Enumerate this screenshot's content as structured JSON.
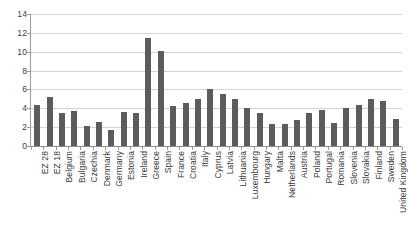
{
  "chart_data": {
    "type": "bar",
    "title": "",
    "subtitle": "",
    "xlabel": "",
    "ylabel": "",
    "ylim": [
      0,
      14
    ],
    "ytick_step": 2,
    "yticks": [
      "0",
      "2",
      "4",
      "6",
      "8",
      "10",
      "12",
      "14"
    ],
    "grid": true,
    "legend": false,
    "bar_color": "#5c5c5c",
    "gridline_color": "#d4d4d4",
    "axis_color": "#9a9a9a",
    "categories": [
      "EZ 28",
      "EZ 18",
      "Belgium",
      "Bulgaria",
      "Czechia",
      "Denmark",
      "Germany",
      "Estonia",
      "Ireland",
      "Greece",
      "Spain",
      "France",
      "Croatia",
      "Italy",
      "Cyprus",
      "Latvia",
      "Lithuania",
      "Luxembourg",
      "Hungary",
      "Malta",
      "Netherlands",
      "Austria",
      "Poland",
      "Portugal",
      "Romania",
      "Slovenia",
      "Slovakia",
      "Finland",
      "Sweden",
      "United Kingdom"
    ],
    "values": [
      4.3,
      5.2,
      3.5,
      3.7,
      2.1,
      2.5,
      1.7,
      3.6,
      3.5,
      11.5,
      10.1,
      4.2,
      4.6,
      5.0,
      6.0,
      5.5,
      5.0,
      4.0,
      3.5,
      2.3,
      2.3,
      2.8,
      3.5,
      3.8,
      2.4,
      4.0,
      4.3,
      5.0,
      4.8,
      2.9
    ]
  }
}
